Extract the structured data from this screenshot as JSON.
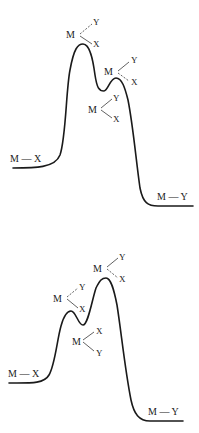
{
  "diagrams": [
    {
      "name": "energy-profile-1",
      "reactant": {
        "label": "M — X"
      },
      "product": {
        "label": "M — Y"
      },
      "transition_state_1": {
        "center": "M",
        "upper": "Y",
        "lower": "X"
      },
      "transition_state_2": {
        "center": "M",
        "upper": "Y",
        "lower": "X"
      },
      "intermediate": {
        "center": "M",
        "upper": "Y",
        "lower": "X"
      }
    },
    {
      "name": "energy-profile-2",
      "reactant": {
        "label": "M — X"
      },
      "product": {
        "label": "M — Y"
      },
      "transition_state_1": {
        "center": "M",
        "upper": "Y",
        "lower": "X"
      },
      "transition_state_2": {
        "center": "M",
        "upper": "Y",
        "lower": "X"
      },
      "intermediate": {
        "center": "M",
        "upper": "X",
        "lower": "Y"
      }
    }
  ]
}
